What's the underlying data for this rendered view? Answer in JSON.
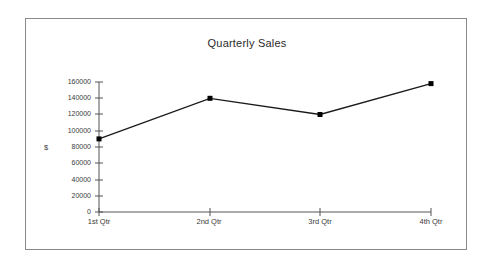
{
  "chart_data": {
    "type": "line",
    "title": "Quarterly Sales",
    "xlabel": "",
    "ylabel": "$",
    "categories": [
      "1st Qtr",
      "2nd Qtr",
      "3rd Qtr",
      "4th Qtr"
    ],
    "series": [
      {
        "name": "Sales",
        "values": [
          90000,
          140000,
          120000,
          158000
        ]
      }
    ],
    "ylim": [
      0,
      160000
    ],
    "yticks": [
      0,
      20000,
      40000,
      60000,
      80000,
      100000,
      120000,
      140000,
      160000
    ],
    "ytick_labels": [
      "0",
      "20000",
      "40000",
      "60000",
      "80000",
      "100000",
      "120000",
      "140000",
      "160000"
    ],
    "grid": false,
    "legend": false,
    "marker": "square",
    "line_color": "#1a1a1a",
    "marker_color": "#000000",
    "axis_color": "#555555",
    "background_color": "#ffffff",
    "border_color": "#8a8a8a"
  }
}
